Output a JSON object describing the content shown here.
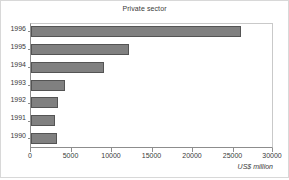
{
  "chart_data": {
    "type": "bar",
    "orientation": "horizontal",
    "title": "Private sector",
    "xlabel": "US$ million",
    "ylabel": "",
    "categories": [
      "1996",
      "1995",
      "1994",
      "1993",
      "1992",
      "1991",
      "1990"
    ],
    "values": [
      26000,
      12100,
      9000,
      4200,
      3300,
      3000,
      3200
    ],
    "xlim": [
      0,
      30000
    ],
    "xticks": [
      0,
      5000,
      10000,
      15000,
      20000,
      25000,
      30000
    ],
    "xtick_labels": [
      "0",
      "5000",
      "10000",
      "15000",
      "20000",
      "25000",
      "30000"
    ],
    "grid": false,
    "legend": null,
    "bar_color": "#808080",
    "bar_edge_color": "#545454",
    "background_color": "#ffffff",
    "axis_color": "#8d8d8d",
    "text_color": "#3a3a3a"
  }
}
